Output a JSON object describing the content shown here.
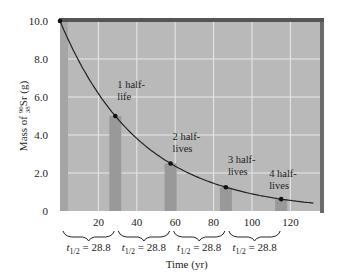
{
  "chart_data": {
    "type": "line",
    "title": "",
    "xlabel": "Time (yr)",
    "ylabel": "Mass of 90/38 Sr (g)",
    "ylabel_parts": {
      "prefix": "Mass of ",
      "mass_number": "90",
      "atomic_number": "38",
      "symbol": "Sr",
      "suffix": " (g)"
    },
    "xlim": [
      0,
      135
    ],
    "ylim": [
      0,
      10.0
    ],
    "x_ticks": [
      20,
      40,
      60,
      80,
      100,
      120
    ],
    "x_tick_labels": [
      "20",
      "40",
      "60",
      "80",
      "100",
      "120"
    ],
    "y_ticks": [
      0,
      2.0,
      4.0,
      6.0,
      8.0,
      10.0
    ],
    "y_tick_labels": [
      "0",
      "2.0",
      "4.0",
      "6.0",
      "8.0",
      "10.0"
    ],
    "grid": true,
    "series": [
      {
        "name": "Decay curve",
        "x": [
          0,
          28.8,
          57.6,
          86.4,
          115.2
        ],
        "y": [
          10.0,
          5.0,
          2.5,
          1.25,
          0.625
        ]
      }
    ],
    "bars": {
      "x": [
        28.8,
        57.6,
        86.4,
        115.2
      ],
      "values": [
        5.0,
        2.5,
        1.25,
        0.625
      ]
    },
    "annotations": [
      {
        "text_line1": "1 half-",
        "text_line2": "life",
        "x": 28.8,
        "y": 5.0
      },
      {
        "text_line1": "2 half-",
        "text_line2": "lives",
        "x": 57.6,
        "y": 2.5
      },
      {
        "text_line1": "3 half-",
        "text_line2": "lives",
        "x": 86.4,
        "y": 1.25
      },
      {
        "text_line1": "4 half-",
        "text_line2": "lives",
        "x": 115.2,
        "y": 0.625
      }
    ],
    "half_life_braces": [
      {
        "label_t": "t",
        "label_sub": "1/2",
        "label_value": " = 28.8"
      },
      {
        "label_t": "t",
        "label_sub": "1/2",
        "label_value": " = 28.8"
      },
      {
        "label_t": "t",
        "label_sub": "1/2",
        "label_value": " = 28.8"
      },
      {
        "label_t": "t",
        "label_sub": "1/2",
        "label_value": " = 28.8"
      }
    ],
    "colors": {
      "plot_bg": "#b9b9b9",
      "grid": "#e8e8e8",
      "bar": "#999999",
      "left_wall": "#a5a5a5",
      "frame": "#555555",
      "curve": "#222222"
    }
  }
}
